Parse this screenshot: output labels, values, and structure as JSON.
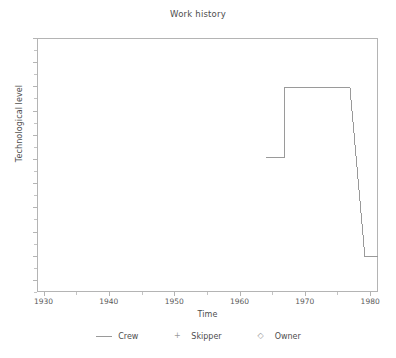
{
  "chart_data": {
    "type": "line",
    "title": "Work history",
    "xlabel": "Time",
    "ylabel": "Technological level",
    "xlim": [
      1929.0,
      1981.2
    ],
    "ylim": [
      0,
      1
    ],
    "grid": false,
    "legend_position": "bottom",
    "xticks": [
      1930,
      1940,
      1950,
      1960,
      1970,
      1980
    ],
    "xticklabels": [
      "1930",
      "1940",
      "1950",
      "1960",
      "1970",
      "1980"
    ],
    "yticks": [],
    "yticklabels": [],
    "series": [
      {
        "name": "Crew",
        "marker": "line",
        "color": "#9a9a9a",
        "x": [
          1964.1,
          1966.9,
          1966.9,
          1976.9,
          1979.2,
          1979.2,
          1981.2
        ],
        "y": [
          0.531,
          0.531,
          0.807,
          0.807,
          0.138,
          0.138,
          0.138
        ],
        "points": [
          {
            "x": 1964.1,
            "y": 0.531
          },
          {
            "x": 1966.9,
            "y": 0.531
          },
          {
            "x": 1966.9,
            "y": 0.807
          },
          {
            "x": 1976.9,
            "y": 0.807
          },
          {
            "x": 1979.2,
            "y": 0.138
          },
          {
            "x": 1981.2,
            "y": 0.138
          }
        ]
      },
      {
        "name": "Skipper",
        "marker": "+",
        "color": "#9a9a9a",
        "x": [],
        "y": []
      },
      {
        "name": "Owner",
        "marker": "diamond",
        "color": "#9a9a9a",
        "x": [],
        "y": []
      }
    ]
  },
  "chart": {
    "title": "Work history",
    "xlabel": "Time",
    "ylabel": "Technological level",
    "legend": [
      {
        "label": "Crew",
        "glyph": "line"
      },
      {
        "label": "Skipper",
        "glyph": "+"
      },
      {
        "label": "Owner",
        "glyph": "◇"
      }
    ],
    "colors": {
      "line": "#9a9a9a",
      "axis": "#b4b4b4",
      "text": "#4d4d4d",
      "background": "#ffffff"
    }
  }
}
